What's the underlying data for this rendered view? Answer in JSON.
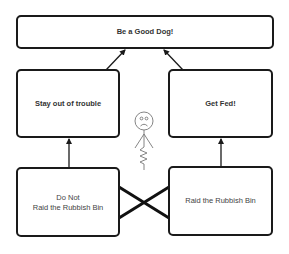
{
  "diagram": {
    "top_goal": {
      "label": "Be a Good Dog!"
    },
    "goals": [
      {
        "label": "Stay out of trouble"
      },
      {
        "label": "Get Fed!"
      }
    ],
    "actions": [
      {
        "line1": "Do Not",
        "line2": "Raid the Rubbish Bin"
      },
      {
        "label": "Raid the Rubbish Bin"
      }
    ],
    "figure": {
      "description": "sad stick figure",
      "icon": "stick-figure-icon"
    },
    "conflict": {
      "icon": "cross-conflict-icon"
    },
    "colors": {
      "stroke": "#1a1a1a",
      "text": "#333333",
      "background": "#ffffff"
    }
  }
}
